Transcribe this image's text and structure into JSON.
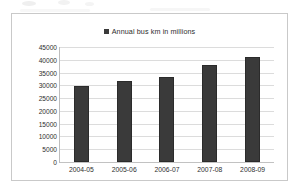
{
  "chart_data": {
    "type": "bar",
    "title": "",
    "subtitle": "",
    "xlabel": "",
    "ylabel": "",
    "categories": [
      "2004-05",
      "2005-06",
      "2006-07",
      "2007-08",
      "2008-09"
    ],
    "values": [
      29700,
      31600,
      33400,
      38000,
      41000
    ],
    "series": [
      {
        "name": "Annual bus km in millions",
        "values": [
          29700,
          31600,
          33400,
          38000,
          41000
        ]
      }
    ],
    "ylim": [
      0,
      45000
    ],
    "ytick_step": 5000,
    "yticks": [
      45000,
      40000,
      35000,
      30000,
      25000,
      20000,
      15000,
      10000,
      5000,
      0
    ],
    "ytick_labels": [
      "45000",
      "40000",
      "35000",
      "30000",
      "25000",
      "20000",
      "15000",
      "10000",
      "5000",
      "0"
    ],
    "grid": true,
    "grid_axis": "y",
    "legend": [
      "Annual bus km in millions"
    ],
    "legend_position": "top-center",
    "bar_color": "#3a3a3a",
    "gridline_color": "#dcdcdc",
    "plot_background": "#ffffff",
    "frame_color": "#c9c9c9"
  },
  "legend": {
    "marker_name": "legend-swatch-icon",
    "label": "Annual bus km in millions"
  }
}
